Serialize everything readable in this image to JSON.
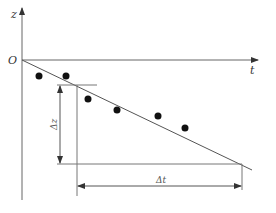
{
  "diagram": {
    "axes": {
      "vertical_label": "z",
      "horizontal_label": "t",
      "origin_label": "O"
    },
    "dimensions": {
      "delta_z_label": "Δz",
      "delta_t_label": "Δt"
    },
    "elements": {
      "regression_line": "fitted straight line through origin",
      "data_points_count": 6
    },
    "colors": {
      "line": "#555555",
      "points": "#111111",
      "background": "#ffffff"
    }
  }
}
